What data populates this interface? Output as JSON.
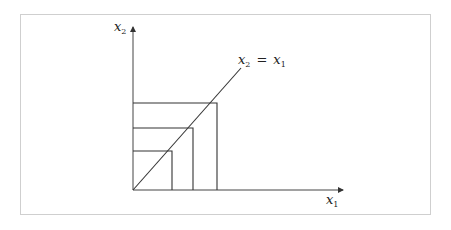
{
  "diagram": {
    "type": "indifference-map-perfect-complements",
    "axes": {
      "y_label": "x",
      "y_sub": "2",
      "x_label": "x",
      "x_sub": "1"
    },
    "line_label": {
      "lhs": "x",
      "lhs_sub": "2",
      "eq": "=",
      "rhs": "x",
      "rhs_sub": "1"
    },
    "curves": [
      {
        "corner_x": 172,
        "corner_y": 151
      },
      {
        "corner_x": 193,
        "corner_y": 128
      },
      {
        "corner_x": 217,
        "corner_y": 103
      }
    ],
    "colors": {
      "line": "#333333",
      "frame": "#cfcfcf"
    }
  }
}
